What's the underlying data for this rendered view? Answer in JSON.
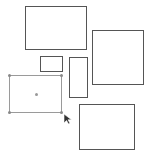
{
  "canvas": {
    "background": "#ffffff",
    "stroke_color": "#555555",
    "selection_color": "#9a9a9a"
  },
  "shapes": [
    {
      "id": "rect-top",
      "x": 25,
      "y": 6,
      "w": 62,
      "h": 44,
      "selected": false
    },
    {
      "id": "rect-right",
      "x": 92,
      "y": 30,
      "w": 52,
      "h": 55,
      "selected": false
    },
    {
      "id": "rect-small",
      "x": 40,
      "y": 56,
      "w": 23,
      "h": 16,
      "selected": false
    },
    {
      "id": "rect-tall",
      "x": 69,
      "y": 57,
      "w": 19,
      "h": 41,
      "selected": false
    },
    {
      "id": "rect-selected",
      "x": 9,
      "y": 75,
      "w": 53,
      "h": 38,
      "selected": true
    },
    {
      "id": "rect-bottom",
      "x": 79,
      "y": 104,
      "w": 56,
      "h": 46,
      "selected": false
    }
  ],
  "cursor": {
    "type": "arrow-pointer-icon",
    "x": 63,
    "y": 114
  }
}
